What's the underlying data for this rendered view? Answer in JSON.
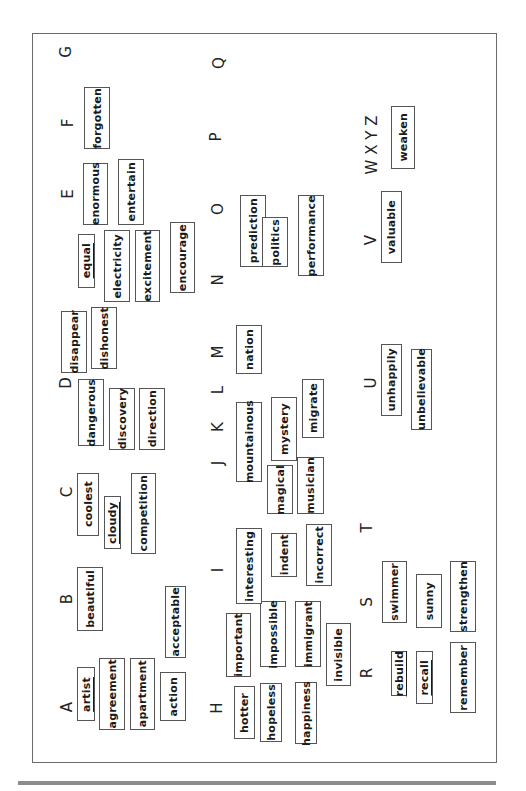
{
  "document": {
    "orientation": "rotated 90 degrees counterclockwise",
    "letters": [
      {
        "id": "A",
        "label": "A",
        "x": 67,
        "y": 707
      },
      {
        "id": "B",
        "label": "B",
        "x": 67,
        "y": 599
      },
      {
        "id": "C",
        "label": "C",
        "x": 67,
        "y": 492
      },
      {
        "id": "D",
        "label": "D",
        "x": 66,
        "y": 383
      },
      {
        "id": "E",
        "label": "E",
        "x": 68,
        "y": 194
      },
      {
        "id": "F",
        "label": "F",
        "x": 68,
        "y": 123
      },
      {
        "id": "G",
        "label": "G",
        "x": 66,
        "y": 52
      },
      {
        "id": "H",
        "label": "H",
        "x": 217,
        "y": 708
      },
      {
        "id": "I",
        "label": "I",
        "x": 218,
        "y": 570
      },
      {
        "id": "J",
        "label": "J",
        "x": 218,
        "y": 463
      },
      {
        "id": "K",
        "label": "K",
        "x": 218,
        "y": 427
      },
      {
        "id": "L",
        "label": "L",
        "x": 218,
        "y": 390
      },
      {
        "id": "M",
        "label": "M",
        "x": 218,
        "y": 352
      },
      {
        "id": "N",
        "label": "N",
        "x": 218,
        "y": 280
      },
      {
        "id": "O",
        "label": "O",
        "x": 218,
        "y": 209
      },
      {
        "id": "P",
        "label": "P",
        "x": 216,
        "y": 137
      },
      {
        "id": "Q",
        "label": "Q",
        "x": 219,
        "y": 63
      },
      {
        "id": "R",
        "label": "R",
        "x": 367,
        "y": 673
      },
      {
        "id": "S",
        "label": "S",
        "x": 367,
        "y": 602
      },
      {
        "id": "T",
        "label": "T",
        "x": 367,
        "y": 528
      },
      {
        "id": "U",
        "label": "U",
        "x": 371,
        "y": 383
      },
      {
        "id": "V",
        "label": "V",
        "x": 371,
        "y": 240
      },
      {
        "id": "WXYZ",
        "label": "W X Y Z",
        "x": 372,
        "y": 145
      }
    ],
    "words": [
      {
        "text": "artist",
        "x": 77,
        "y": 667,
        "w": 18,
        "h": 54,
        "underline": true
      },
      {
        "text": "agreement",
        "x": 99,
        "y": 658,
        "w": 26,
        "h": 72
      },
      {
        "text": "apartment",
        "x": 130,
        "y": 658,
        "w": 25,
        "h": 72
      },
      {
        "text": "action",
        "x": 160,
        "y": 672,
        "w": 26,
        "h": 49
      },
      {
        "text": "acceptable",
        "x": 165,
        "y": 586,
        "w": 21,
        "h": 72
      },
      {
        "text": "beautiful",
        "x": 77,
        "y": 567,
        "w": 26,
        "h": 64
      },
      {
        "text": "coolest",
        "x": 77,
        "y": 473,
        "w": 22,
        "h": 63
      },
      {
        "text": "cloudy",
        "x": 104,
        "y": 496,
        "w": 17,
        "h": 53,
        "underline": true
      },
      {
        "text": "competition",
        "x": 131,
        "y": 473,
        "w": 25,
        "h": 81
      },
      {
        "text": "dangerous",
        "x": 78,
        "y": 379,
        "w": 26,
        "h": 67
      },
      {
        "text": "discovery",
        "x": 109,
        "y": 388,
        "w": 26,
        "h": 62
      },
      {
        "text": "direction",
        "x": 139,
        "y": 388,
        "w": 26,
        "h": 62
      },
      {
        "text": "disappear",
        "x": 61,
        "y": 311,
        "w": 26,
        "h": 62
      },
      {
        "text": "dishonest",
        "x": 91,
        "y": 307,
        "w": 26,
        "h": 62
      },
      {
        "text": "equal",
        "x": 78,
        "y": 234,
        "w": 17,
        "h": 54,
        "underline": true
      },
      {
        "text": "electricity",
        "x": 104,
        "y": 230,
        "w": 26,
        "h": 72
      },
      {
        "text": "excitement",
        "x": 135,
        "y": 230,
        "w": 25,
        "h": 72
      },
      {
        "text": "encourage",
        "x": 170,
        "y": 222,
        "w": 25,
        "h": 71
      },
      {
        "text": "enormous",
        "x": 83,
        "y": 163,
        "w": 25,
        "h": 62
      },
      {
        "text": "entertain",
        "x": 118,
        "y": 159,
        "w": 26,
        "h": 66
      },
      {
        "text": "forgotten",
        "x": 84,
        "y": 87,
        "w": 26,
        "h": 62
      },
      {
        "text": "hotter",
        "x": 234,
        "y": 686,
        "w": 21,
        "h": 53
      },
      {
        "text": "hopeless",
        "x": 260,
        "y": 683,
        "w": 22,
        "h": 59
      },
      {
        "text": "happiness",
        "x": 295,
        "y": 682,
        "w": 22,
        "h": 62
      },
      {
        "text": "important",
        "x": 226,
        "y": 613,
        "w": 25,
        "h": 64
      },
      {
        "text": "impossible",
        "x": 260,
        "y": 601,
        "w": 26,
        "h": 66
      },
      {
        "text": "immigrant",
        "x": 295,
        "y": 601,
        "w": 26,
        "h": 66
      },
      {
        "text": "invisible",
        "x": 326,
        "y": 623,
        "w": 25,
        "h": 63
      },
      {
        "text": "interesting",
        "x": 236,
        "y": 528,
        "w": 26,
        "h": 76
      },
      {
        "text": "indent",
        "x": 271,
        "y": 533,
        "w": 26,
        "h": 44
      },
      {
        "text": "incorrect",
        "x": 306,
        "y": 524,
        "w": 26,
        "h": 62
      },
      {
        "text": "mountainous",
        "x": 236,
        "y": 402,
        "w": 26,
        "h": 80
      },
      {
        "text": "mystery",
        "x": 271,
        "y": 397,
        "w": 26,
        "h": 64
      },
      {
        "text": "magical",
        "x": 267,
        "y": 465,
        "w": 26,
        "h": 49
      },
      {
        "text": "musician",
        "x": 297,
        "y": 457,
        "w": 27,
        "h": 57
      },
      {
        "text": "migrate",
        "x": 302,
        "y": 379,
        "w": 22,
        "h": 59
      },
      {
        "text": "nation",
        "x": 236,
        "y": 325,
        "w": 26,
        "h": 49
      },
      {
        "text": "prediction",
        "x": 240,
        "y": 195,
        "w": 26,
        "h": 72
      },
      {
        "text": "politics",
        "x": 262,
        "y": 217,
        "w": 26,
        "h": 50
      },
      {
        "text": "performance",
        "x": 298,
        "y": 195,
        "w": 26,
        "h": 81
      },
      {
        "text": "rebuild",
        "x": 391,
        "y": 651,
        "w": 16,
        "h": 45,
        "underline": true
      },
      {
        "text": "recall",
        "x": 416,
        "y": 651,
        "w": 17,
        "h": 53,
        "underline": true
      },
      {
        "text": "remember",
        "x": 450,
        "y": 642,
        "w": 26,
        "h": 71
      },
      {
        "text": "swimmer",
        "x": 382,
        "y": 561,
        "w": 25,
        "h": 62
      },
      {
        "text": "sunny",
        "x": 416,
        "y": 574,
        "w": 26,
        "h": 54
      },
      {
        "text": "strengthen",
        "x": 450,
        "y": 561,
        "w": 26,
        "h": 71
      },
      {
        "text": "unhappily",
        "x": 381,
        "y": 344,
        "w": 21,
        "h": 72
      },
      {
        "text": "unbelievable",
        "x": 411,
        "y": 349,
        "w": 21,
        "h": 81
      },
      {
        "text": "valuable",
        "x": 381,
        "y": 191,
        "w": 21,
        "h": 72
      },
      {
        "text": "weaken",
        "x": 391,
        "y": 106,
        "w": 24,
        "h": 63
      }
    ]
  }
}
